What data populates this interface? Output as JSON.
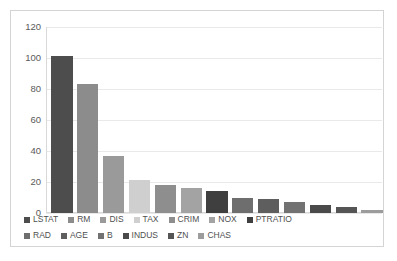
{
  "chart_data": {
    "type": "bar",
    "title": "",
    "xlabel": "",
    "ylabel": "",
    "ylim": [
      0,
      120
    ],
    "yticks": [
      0,
      20,
      40,
      60,
      80,
      100,
      120
    ],
    "ytick_labels": [
      "0",
      "20",
      "40",
      "60",
      "80",
      "100",
      "120"
    ],
    "grid": true,
    "legend_position": "bottom",
    "categories": [
      "LSTAT",
      "RM",
      "DIS",
      "TAX",
      "CRIM",
      "NOX",
      "PTRATIO",
      "RAD",
      "AGE",
      "B",
      "INDUS",
      "ZN",
      "CHAS"
    ],
    "values": [
      101,
      83,
      37,
      21,
      18,
      16,
      14,
      10,
      9,
      7,
      5,
      4,
      2
    ],
    "colors": [
      "#4d4d4d",
      "#8c8c8c",
      "#9a9a9a",
      "#cfcfcf",
      "#8e8e8e",
      "#a3a3a3",
      "#3f3f3f",
      "#6e6e6e",
      "#5e5e5e",
      "#727272",
      "#4a4a4a",
      "#555555",
      "#9c9c9c"
    ],
    "series": [
      {
        "name": "Feature Importance",
        "values": [
          101,
          83,
          37,
          21,
          18,
          16,
          14,
          10,
          9,
          7,
          5,
          4,
          2
        ]
      }
    ]
  },
  "legend": {
    "rows": [
      [
        {
          "label": "LSTAT",
          "color": "#4d4d4d"
        },
        {
          "label": "RM",
          "color": "#8c8c8c"
        },
        {
          "label": "DIS",
          "color": "#9a9a9a"
        },
        {
          "label": "TAX",
          "color": "#cfcfcf"
        },
        {
          "label": "CRIM",
          "color": "#8e8e8e"
        },
        {
          "label": "NOX",
          "color": "#a3a3a3"
        },
        {
          "label": "PTRATIO",
          "color": "#3f3f3f"
        }
      ],
      [
        {
          "label": "RAD",
          "color": "#6e6e6e"
        },
        {
          "label": "AGE",
          "color": "#5e5e5e"
        },
        {
          "label": "B",
          "color": "#727272"
        },
        {
          "label": "INDUS",
          "color": "#4a4a4a"
        },
        {
          "label": "ZN",
          "color": "#555555"
        },
        {
          "label": "CHAS",
          "color": "#9c9c9c"
        }
      ]
    ]
  },
  "style": {
    "background": "#ffffff",
    "frame_border": "#d4d4d4",
    "gridline": "#e9e9e9",
    "tick_text": "#5a5a5a",
    "legend_text": "#4f4f4f"
  }
}
